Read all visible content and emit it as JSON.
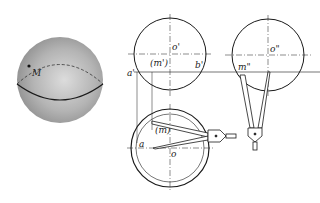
{
  "diagram": {
    "type": "orthographic projection of a sphere with point M",
    "colors": {
      "line": "#1a1a1a",
      "sphere_light": "#d8d8d8",
      "sphere_dark": "#8a8a8a",
      "background": "#ffffff"
    },
    "sphere_3d": {
      "point_label": "M"
    },
    "front_view": {
      "center_label": "o'",
      "point_label": "(m')",
      "left_label": "a'",
      "right_label": "b'"
    },
    "side_view": {
      "center_label": "o\"",
      "point_label": "m\""
    },
    "top_view": {
      "center_label": "o",
      "point_label": "(m)",
      "left_label": "a"
    }
  }
}
